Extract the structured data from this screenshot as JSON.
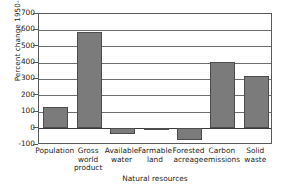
{
  "chart_data": {
    "type": "bar",
    "title": "",
    "xlabel": "",
    "ylabel": "Percent change 1950-2000",
    "ylim": [
      -100,
      700
    ],
    "yticks": [
      700,
      600,
      500,
      400,
      300,
      200,
      100,
      0,
      -100
    ],
    "ytick_labels": [
      "700",
      "600",
      "500",
      "400",
      "300",
      "200",
      "100",
      "0",
      "-100"
    ],
    "grid": true,
    "legend": "none",
    "categories": [
      "Population",
      "Gross world product",
      "Available water",
      "Farmable land",
      "Forested acreage",
      "Carbon emissions",
      "Solid waste"
    ],
    "category_label_lines": [
      [
        "Population"
      ],
      [
        "Gross",
        "world",
        "product"
      ],
      [
        "Available",
        "water"
      ],
      [
        "Farmable",
        "land"
      ],
      [
        "Forested",
        "acreage"
      ],
      [
        "Carbon",
        "emissions"
      ],
      [
        "Solid",
        "waste"
      ]
    ],
    "values": [
      130,
      585,
      -35,
      -12,
      -70,
      403,
      318
    ],
    "bar_color": "#7b7b7b",
    "bar_edge_color": "#4d4d4f",
    "annotations": [
      {
        "text": "Natural resources",
        "type": "group-bracket",
        "covers": [
          "Available water",
          "Farmable land",
          "Forested acreage"
        ]
      }
    ]
  },
  "group_bracket": {
    "label": "Natural resources"
  }
}
